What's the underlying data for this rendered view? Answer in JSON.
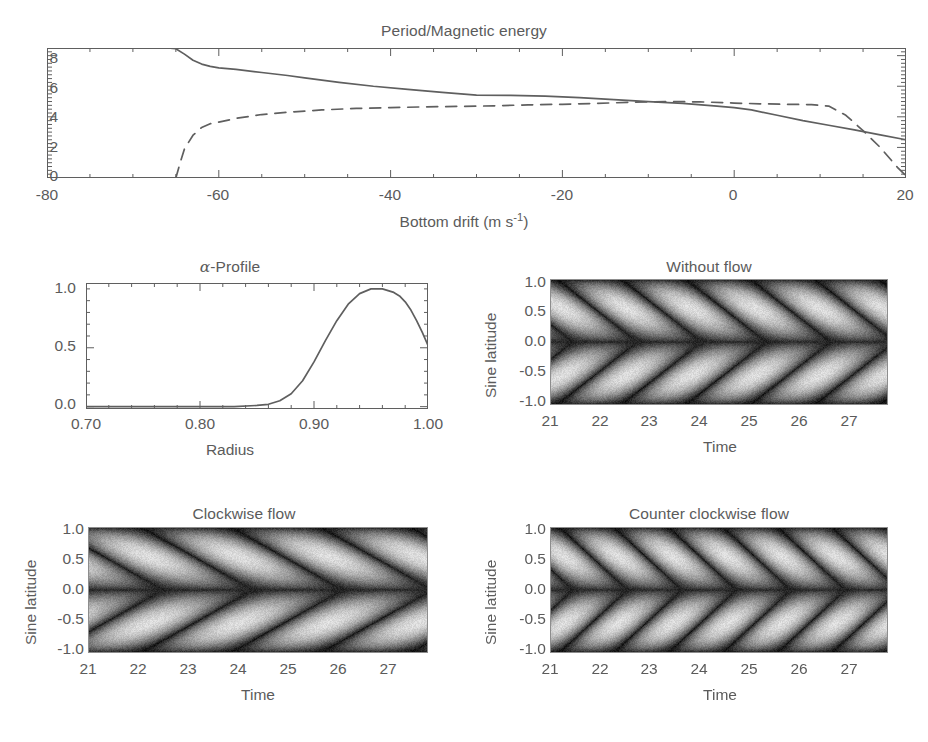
{
  "figure": {
    "background": "#ffffff",
    "line_color": "#5f5f5f",
    "text_color": "#5b5b5b"
  },
  "panels": {
    "period": {
      "title": "Period/Magnetic energy",
      "xlabel_main": "Bottom drift (m s",
      "xlabel_sup": "-1",
      "xlabel_tail": ")",
      "xticks": [
        "-80",
        "-60",
        "-40",
        "-20",
        "0",
        "20"
      ],
      "yticks": [
        "0",
        "2",
        "4",
        "6",
        "8"
      ]
    },
    "alpha": {
      "title_greek": "α",
      "title_rest": "-Profile",
      "xlabel": "Radius",
      "xticks": [
        "0.70",
        "0.80",
        "0.90",
        "1.00"
      ],
      "yticks": [
        "0.0",
        "0.5",
        "1.0"
      ]
    },
    "without_flow": {
      "title": "Without flow",
      "xlabel": "Time",
      "ylabel": "Sine latitude",
      "xticks": [
        "21",
        "22",
        "23",
        "24",
        "25",
        "26",
        "27"
      ],
      "yticks": [
        "1.0",
        "0.5",
        "0.0",
        "-0.5",
        "-1.0"
      ]
    },
    "clockwise": {
      "title": "Clockwise flow",
      "xlabel": "Time",
      "ylabel": "Sine latitude",
      "xticks": [
        "21",
        "22",
        "23",
        "24",
        "25",
        "26",
        "27"
      ],
      "yticks": [
        "1.0",
        "0.5",
        "0.0",
        "-0.5",
        "-1.0"
      ]
    },
    "counter_clockwise": {
      "title": "Counter clockwise flow",
      "xlabel": "Time",
      "ylabel": "Sine latitude",
      "xticks": [
        "21",
        "22",
        "23",
        "24",
        "25",
        "26",
        "27"
      ],
      "yticks": [
        "1.0",
        "0.5",
        "0.0",
        "-0.5",
        "-1.0"
      ]
    }
  },
  "chart_data": [
    {
      "type": "line",
      "id": "period-magnetic-energy",
      "title": "Period/Magnetic energy",
      "xlabel": "Bottom drift (m s^-1)",
      "ylabel": "",
      "xlim": [
        -80,
        20
      ],
      "ylim": [
        0,
        8.5
      ],
      "xticks": [
        -80,
        -60,
        -40,
        -20,
        0,
        20
      ],
      "yticks": [
        0,
        2,
        4,
        6,
        8
      ],
      "grid": false,
      "legend": "none",
      "series": [
        {
          "name": "Period",
          "style": "solid",
          "x": [
            -80,
            -70,
            -66,
            -65,
            -64,
            -63,
            -62,
            -61,
            -60,
            -58,
            -55,
            -52,
            -50,
            -46,
            -42,
            -38,
            -34,
            -30,
            -26,
            -22,
            -18,
            -14,
            -10,
            -6,
            -2,
            0,
            2,
            5,
            8,
            11,
            14,
            17,
            20
          ],
          "y": [
            8.5,
            8.5,
            8.5,
            8.45,
            8.1,
            7.7,
            7.45,
            7.3,
            7.2,
            7.1,
            6.9,
            6.7,
            6.55,
            6.25,
            6.0,
            5.8,
            5.6,
            5.42,
            5.4,
            5.35,
            5.25,
            5.12,
            5.0,
            4.88,
            4.7,
            4.6,
            4.45,
            4.1,
            3.75,
            3.45,
            3.15,
            2.82,
            2.5
          ]
        },
        {
          "name": "Magnetic energy",
          "style": "dashed",
          "x": [
            -65,
            -64.5,
            -64,
            -63,
            -62,
            -61,
            -60,
            -58,
            -55,
            -52,
            -48,
            -44,
            -40,
            -36,
            -32,
            -28,
            -24,
            -20,
            -16,
            -12,
            -8,
            -4,
            0,
            3,
            6,
            9,
            11,
            13,
            15,
            17,
            19,
            20
          ],
          "y": [
            0.0,
            1.0,
            1.9,
            2.8,
            3.3,
            3.55,
            3.65,
            3.9,
            4.15,
            4.3,
            4.45,
            4.55,
            4.6,
            4.65,
            4.68,
            4.72,
            4.78,
            4.82,
            4.88,
            4.95,
            5.0,
            4.98,
            4.9,
            4.85,
            4.82,
            4.8,
            4.7,
            4.1,
            3.1,
            2.0,
            0.7,
            0.15
          ]
        }
      ]
    },
    {
      "type": "line",
      "id": "alpha-profile",
      "title": "alpha-Profile",
      "xlabel": "Radius",
      "ylabel": "",
      "xlim": [
        0.7,
        1.0
      ],
      "ylim": [
        -0.02,
        1.05
      ],
      "xticks": [
        0.7,
        0.8,
        0.9,
        1.0
      ],
      "yticks": [
        0.0,
        0.5,
        1.0
      ],
      "grid": false,
      "legend": "none",
      "series": [
        {
          "name": "alpha",
          "style": "solid",
          "x": [
            0.7,
            0.75,
            0.8,
            0.83,
            0.85,
            0.86,
            0.87,
            0.88,
            0.89,
            0.9,
            0.91,
            0.92,
            0.93,
            0.94,
            0.95,
            0.96,
            0.97,
            0.975,
            0.98,
            0.985,
            0.99,
            0.995,
            1.0
          ],
          "y": [
            0.0,
            0.0,
            0.0,
            0.0,
            0.01,
            0.02,
            0.05,
            0.11,
            0.22,
            0.38,
            0.56,
            0.73,
            0.87,
            0.96,
            1.0,
            1.0,
            0.97,
            0.94,
            0.89,
            0.82,
            0.73,
            0.63,
            0.52
          ]
        }
      ]
    },
    {
      "type": "heatmap",
      "id": "butterfly-without-flow",
      "title": "Without flow",
      "xlabel": "Time",
      "ylabel": "Sine latitude",
      "xlim": [
        21,
        27.8
      ],
      "ylim": [
        -1.0,
        1.0
      ],
      "xticks": [
        21,
        22,
        23,
        24,
        25,
        26,
        27
      ],
      "yticks": [
        -1.0,
        -0.5,
        0.0,
        0.5,
        1.0
      ],
      "colormap": "grayscale",
      "period": 2.6,
      "drift": "equatorward",
      "cycles": 2.6,
      "grid": false
    },
    {
      "type": "heatmap",
      "id": "butterfly-clockwise-flow",
      "title": "Clockwise flow",
      "xlabel": "Time",
      "ylabel": "Sine latitude",
      "xlim": [
        21,
        27.8
      ],
      "ylim": [
        -1.0,
        1.0
      ],
      "xticks": [
        21,
        22,
        23,
        24,
        25,
        26,
        27
      ],
      "yticks": [
        -1.0,
        -0.5,
        0.0,
        0.5,
        1.0
      ],
      "colormap": "grayscale",
      "period": 3.6,
      "drift": "equatorward",
      "cycles": 1.9,
      "grid": false
    },
    {
      "type": "heatmap",
      "id": "butterfly-counter-clockwise-flow",
      "title": "Counter clockwise flow",
      "xlabel": "Time",
      "ylabel": "Sine latitude",
      "xlim": [
        21,
        27.8
      ],
      "ylim": [
        -1.0,
        1.0
      ],
      "xticks": [
        21,
        22,
        23,
        24,
        25,
        26,
        27
      ],
      "yticks": [
        -1.0,
        -0.5,
        0.0,
        0.5,
        1.0
      ],
      "colormap": "grayscale",
      "period": 2.2,
      "drift": "equatorward",
      "cycles": 3.1,
      "grid": false
    }
  ]
}
